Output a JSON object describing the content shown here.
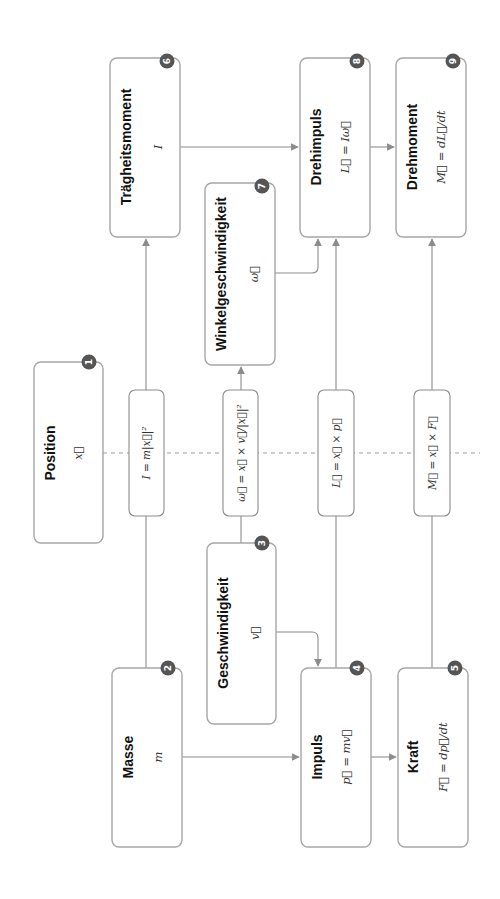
{
  "diagram": {
    "orientation": "rotated-90-ccw",
    "colors": {
      "box_border": "#a6a6a6",
      "connector": "#8c8c8c",
      "badge_fill": "#555555",
      "badge_text": "#ffffff",
      "title_text": "#111111",
      "formula_text": "#333333"
    },
    "nodes": {
      "n1": {
        "number": "1",
        "title": "Position",
        "formula": "x⃗"
      },
      "n2": {
        "number": "2",
        "title": "Masse",
        "formula": "m"
      },
      "n3": {
        "number": "3",
        "title": "Geschwindigkeit",
        "formula": "v⃗"
      },
      "n4": {
        "number": "4",
        "title": "Impuls",
        "formula": "p⃗ = mv⃗"
      },
      "n5": {
        "number": "5",
        "title": "Kraft",
        "formula": "F⃗ = dp⃗/dt"
      },
      "n6": {
        "number": "6",
        "title": "Trägheitsmoment",
        "formula": "I"
      },
      "n7": {
        "number": "7",
        "title": "Winkelgeschwindigkeit",
        "formula": "ω⃗"
      },
      "n8": {
        "number": "8",
        "title": "Drehimpuls",
        "formula": "L⃗ = Iω⃗"
      },
      "n9": {
        "number": "9",
        "title": "Drehmoment",
        "formula": "M⃗ = dL⃗/dt"
      }
    },
    "transforms": {
      "inertia": "I = m|x⃗|²",
      "angular_velocity": "ω⃗ = x⃗ × v⃗/|x⃗|²",
      "angular_momentum": "L⃗ = x⃗ × p⃗",
      "torque": "M⃗ = x⃗ × F⃗"
    },
    "edges": [
      {
        "from": "Masse",
        "to": "Impuls"
      },
      {
        "from": "Geschwindigkeit",
        "to": "Impuls"
      },
      {
        "from": "Impuls",
        "to": "Kraft"
      },
      {
        "from": "Masse",
        "via": "I = m|x⃗|²",
        "to": "Trägheitsmoment"
      },
      {
        "from": "Geschwindigkeit",
        "via": "ω⃗ = x⃗ × v⃗/|x⃗|²",
        "to": "Winkelgeschwindigkeit"
      },
      {
        "from": "Impuls",
        "via": "L⃗ = x⃗ × p⃗",
        "to": "Drehimpuls"
      },
      {
        "from": "Kraft",
        "via": "M⃗ = x⃗ × F⃗",
        "to": "Drehmoment"
      },
      {
        "from": "Trägheitsmoment",
        "to": "Drehimpuls"
      },
      {
        "from": "Winkelgeschwindigkeit",
        "to": "Drehimpuls"
      },
      {
        "from": "Drehimpuls",
        "to": "Drehmoment"
      },
      {
        "from": "Position",
        "to": "transforms",
        "style": "dashed"
      }
    ]
  }
}
